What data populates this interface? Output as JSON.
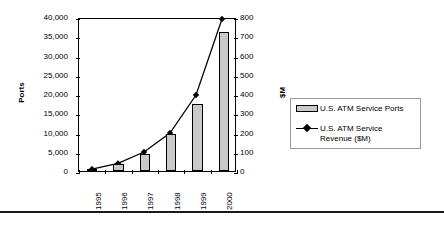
{
  "chart_data": {
    "type": "bar",
    "title": "",
    "xlabel": "",
    "categories": [
      "1995",
      "1996",
      "1997",
      "1998",
      "1999",
      "2000"
    ],
    "grid": false,
    "legend_position": "right",
    "series": [
      {
        "name": "U.S. ATM Service Ports",
        "type": "bar",
        "axis": "left",
        "values": [
          200,
          1800,
          4500,
          9500,
          17500,
          36000
        ]
      },
      {
        "name": "U.S. ATM Service Revenue ($M)",
        "type": "line",
        "axis": "right",
        "marker": "diamond",
        "values": [
          10,
          40,
          100,
          200,
          400,
          800
        ]
      }
    ],
    "axes": {
      "left": {
        "label": "Ports",
        "ylim": [
          0,
          40000
        ],
        "tick_step": 5000,
        "ticks": [
          0,
          5000,
          10000,
          15000,
          20000,
          25000,
          30000,
          35000,
          40000
        ],
        "tick_labels": [
          "0",
          "5,000",
          "10,000",
          "15,000",
          "20,000",
          "25,000",
          "30,000",
          "35,000",
          "40,000"
        ]
      },
      "right": {
        "label": "$M",
        "ylim": [
          0,
          800
        ],
        "tick_step": 100,
        "ticks": [
          0,
          100,
          200,
          300,
          400,
          500,
          600,
          700,
          800
        ],
        "tick_labels": [
          "0",
          "100",
          "200",
          "300",
          "400",
          "500",
          "600",
          "700",
          "800"
        ]
      }
    },
    "colors": {
      "bar_fill": "#c9c9c9",
      "bar_edge": "#000000",
      "line": "#000000",
      "marker": "#000000",
      "axis": "#000000",
      "legend_border": "#9a9a9a"
    }
  },
  "legend": {
    "items": [
      {
        "label": "U.S. ATM Service Ports",
        "marker": "bar-swatch"
      },
      {
        "label": "U.S. ATM Service\nRevenue ($M)",
        "marker": "line-diamond-swatch"
      }
    ]
  }
}
